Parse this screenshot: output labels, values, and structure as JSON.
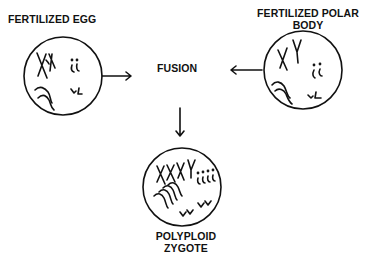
{
  "diagram": {
    "nodes": {
      "fertilized_egg": {
        "label": "FERTILIZED EGG",
        "chromosomes": "XX"
      },
      "fertilized_polar_body": {
        "label_line1": "FERTILIZED POLAR",
        "label_line2": "BODY",
        "chromosomes": "XY"
      },
      "fusion": {
        "label": "FUSION"
      },
      "polyploid_zygote": {
        "label_line1": "POLYPLOID",
        "label_line2": "ZYGOTE",
        "chromosomes": "XXXY"
      }
    },
    "edges": [
      {
        "from": "fertilized_egg",
        "to": "fusion"
      },
      {
        "from": "fertilized_polar_body",
        "to": "fusion"
      },
      {
        "from": "fusion",
        "to": "polyploid_zygote"
      }
    ]
  }
}
